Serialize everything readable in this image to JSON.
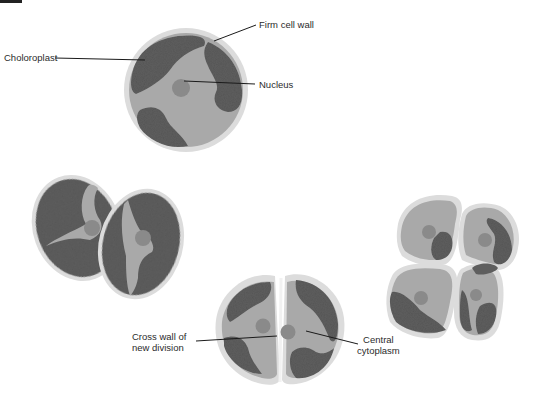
{
  "diagram": {
    "colors": {
      "background": "#ffffff",
      "cell_wall": "#d9d9d9",
      "cytoplasm": "#a8a8a8",
      "chloroplast": "#5a5a5a",
      "nucleus": "#8c8c8c",
      "leader_line": "#1a1a1a",
      "label_text": "#2b2b2b"
    },
    "labels": {
      "chloroplast": "Choloroplast",
      "cell_wall": "Firm cell wall",
      "nucleus": "Nucleus",
      "cross_wall_line1": "Cross wall of",
      "cross_wall_line2": "new division",
      "cytoplasm_line1": "Central",
      "cytoplasm_line2": "cytoplasm"
    },
    "stages": [
      {
        "name": "single-cell",
        "cells": 1
      },
      {
        "name": "two-cell-tilted",
        "cells": 2
      },
      {
        "name": "two-cell-dividing",
        "cells": 2
      },
      {
        "name": "four-cell-cluster",
        "cells": 4
      }
    ]
  }
}
